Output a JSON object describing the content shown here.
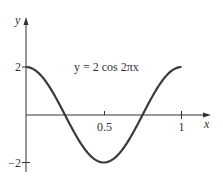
{
  "chart_data": {
    "type": "line",
    "title": "",
    "annotation": "y = 2 cos 2πx",
    "xlabel": "x",
    "ylabel": "y",
    "x_ticks": [
      {
        "value": 0.5,
        "label": "0.5"
      },
      {
        "value": 1,
        "label": "1"
      }
    ],
    "y_ticks": [
      {
        "value": 2,
        "label": "2"
      },
      {
        "value": -2,
        "label": "−2"
      }
    ],
    "xlim": [
      0,
      1.15
    ],
    "ylim": [
      -2.4,
      2.6
    ],
    "grid": false,
    "legend": "none",
    "series": [
      {
        "name": "y = 2 cos 2πx",
        "x": [
          0,
          0.125,
          0.25,
          0.375,
          0.5,
          0.625,
          0.75,
          0.875,
          1
        ],
        "values": [
          2,
          1.414,
          0,
          -1.414,
          -2,
          -1.414,
          0,
          1.414,
          2
        ]
      }
    ],
    "color": "#333333"
  }
}
